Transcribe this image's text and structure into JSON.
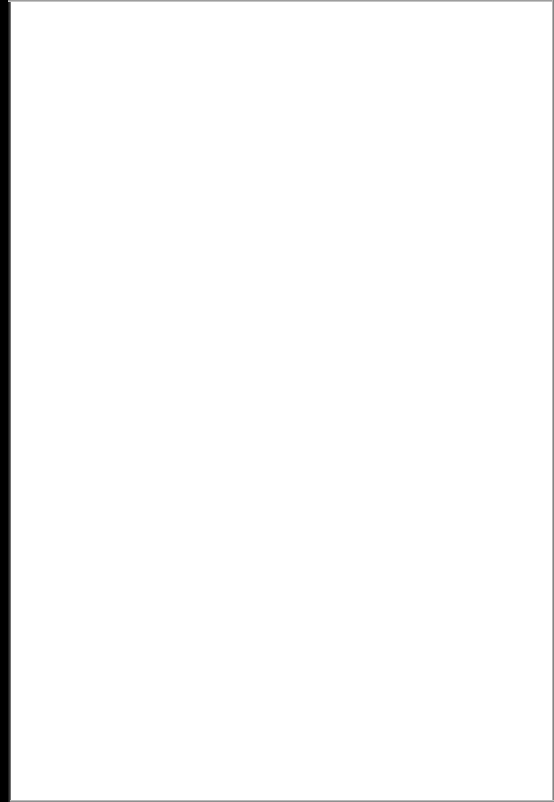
{
  "document": {
    "type": "scanned-page",
    "content": "",
    "page_state": "blank",
    "colors": {
      "paper": "#ffffff",
      "binding_edge": "#000000",
      "border_edge": "#8a8a8a"
    }
  }
}
